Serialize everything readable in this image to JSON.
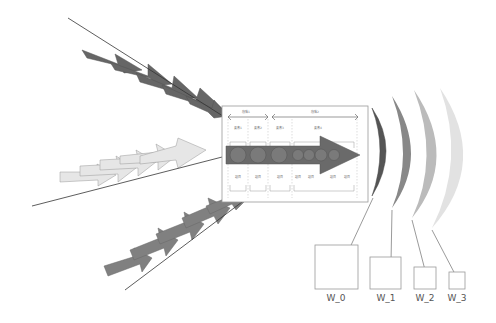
{
  "diagram": {
    "panel": {
      "phase_labels": [
        "段階1",
        "段階2"
      ],
      "top_labels": [
        "要素1",
        "要素2",
        "要素3",
        "要素4"
      ],
      "bottom_labels": [
        "項目",
        "項目",
        "項目",
        "項目",
        "項目",
        "項目",
        "項目"
      ]
    },
    "outputs": [
      {
        "label": "W_0",
        "color": "#555555"
      },
      {
        "label": "W_1",
        "color": "#888888"
      },
      {
        "label": "W_2",
        "color": "#bbbbbb"
      },
      {
        "label": "W_3",
        "color": "#e2e2e2"
      }
    ],
    "input_groups": [
      {
        "name": "top",
        "color": "#666666"
      },
      {
        "name": "middle",
        "color": "#e6e6e6"
      },
      {
        "name": "bottom",
        "color": "#808080"
      }
    ],
    "main_arrow_color": "#6a6a6a"
  }
}
